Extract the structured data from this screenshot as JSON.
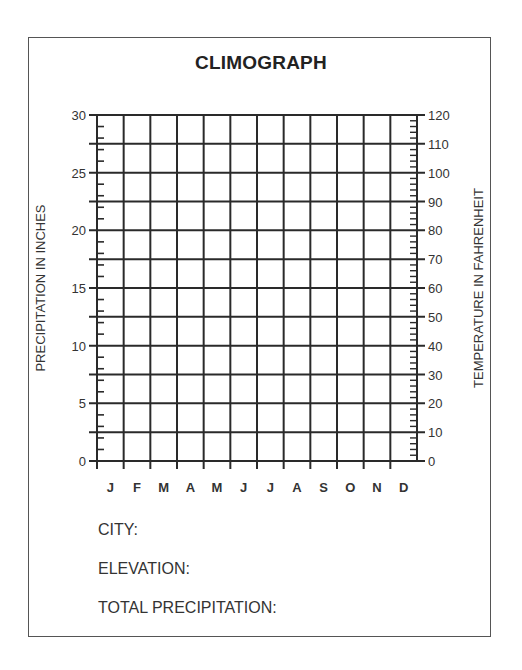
{
  "chart_data": {
    "type": "table",
    "title": "CLIMOGRAPH",
    "xlabel": "",
    "ylabel_left": "PRECIPITATION IN INCHES",
    "ylabel_right": "TEMPERATURE IN FAHRENHEIT",
    "categories": [
      "J",
      "F",
      "M",
      "A",
      "M",
      "J",
      "J",
      "A",
      "S",
      "O",
      "N",
      "D"
    ],
    "left_axis": {
      "ticks": [
        0,
        5,
        10,
        15,
        20,
        25,
        30
      ],
      "ylim": [
        0,
        30
      ],
      "minor_step": 1
    },
    "right_axis": {
      "ticks": [
        0,
        10,
        20,
        30,
        40,
        50,
        60,
        70,
        80,
        90,
        100,
        110,
        120
      ],
      "ylim": [
        0,
        120
      ],
      "minor_step": 2
    },
    "grid": true,
    "series": []
  },
  "title": "CLIMOGRAPH",
  "axes": {
    "left_label": "PRECIPITATION IN INCHES",
    "right_label": "TEMPERATURE IN FAHRENHEIT",
    "left_ticks": [
      "0",
      "5",
      "10",
      "15",
      "20",
      "25",
      "30"
    ],
    "right_ticks": [
      "0",
      "10",
      "20",
      "30",
      "40",
      "50",
      "60",
      "70",
      "80",
      "90",
      "100",
      "110",
      "120"
    ],
    "months": [
      "J",
      "F",
      "M",
      "A",
      "M",
      "J",
      "J",
      "A",
      "S",
      "O",
      "N",
      "D"
    ]
  },
  "fields": {
    "city": "CITY:",
    "elevation": "ELEVATION:",
    "total_precipitation": "TOTAL PRECIPITATION:"
  },
  "colors": {
    "grid": "#2a2a2a",
    "text": "#333333",
    "frame": "#555555"
  }
}
